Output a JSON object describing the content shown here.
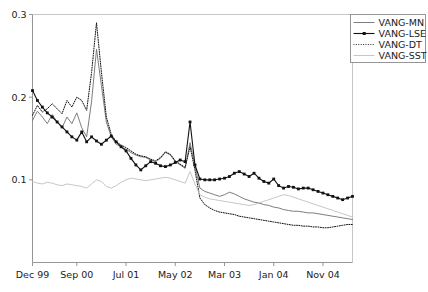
{
  "chart_data": {
    "type": "line",
    "title": "",
    "xlabel": "",
    "ylabel": "",
    "grid": false,
    "legend_position": "top-right",
    "ylim": [
      0.0,
      0.3
    ],
    "yticks": [
      0.1,
      0.2,
      0.3
    ],
    "ytick_labels": [
      "0.1",
      "0.2",
      "0.3"
    ],
    "xticks": [
      0,
      9,
      19,
      29,
      39,
      49,
      59
    ],
    "xtick_labels": [
      "Dec 99",
      "Sep 00",
      "Jul 01",
      "May 02",
      "Mar 03",
      "Jan 04",
      "Nov 04"
    ],
    "x_index_range": [
      0,
      65
    ],
    "series": [
      {
        "name": "VANG-MN",
        "style": "solid",
        "color": "#6e6e6e",
        "marker": "none",
        "values": [
          0.172,
          0.183,
          0.176,
          0.168,
          0.179,
          0.17,
          0.163,
          0.176,
          0.168,
          0.181,
          0.163,
          0.152,
          0.195,
          0.258,
          0.214,
          0.17,
          0.152,
          0.143,
          0.14,
          0.137,
          0.133,
          0.13,
          0.128,
          0.127,
          0.124,
          0.122,
          0.126,
          0.133,
          0.13,
          0.122,
          0.118,
          0.114,
          0.145,
          0.117,
          0.09,
          0.086,
          0.084,
          0.082,
          0.08,
          0.082,
          0.085,
          0.083,
          0.08,
          0.077,
          0.075,
          0.073,
          0.072,
          0.07,
          0.069,
          0.067,
          0.066,
          0.064,
          0.063,
          0.062,
          0.062,
          0.061,
          0.06,
          0.06,
          0.059,
          0.058,
          0.057,
          0.056,
          0.055,
          0.054,
          0.053,
          0.052
        ]
      },
      {
        "name": "VANG-LSE",
        "style": "solid",
        "color": "#111111",
        "marker": "square",
        "values": [
          0.208,
          0.196,
          0.188,
          0.181,
          0.176,
          0.17,
          0.164,
          0.158,
          0.152,
          0.148,
          0.158,
          0.146,
          0.152,
          0.147,
          0.143,
          0.148,
          0.153,
          0.146,
          0.14,
          0.135,
          0.126,
          0.118,
          0.112,
          0.117,
          0.122,
          0.12,
          0.117,
          0.116,
          0.118,
          0.121,
          0.124,
          0.122,
          0.17,
          0.118,
          0.101,
          0.1,
          0.1,
          0.1,
          0.101,
          0.102,
          0.104,
          0.108,
          0.11,
          0.107,
          0.104,
          0.108,
          0.102,
          0.098,
          0.096,
          0.101,
          0.093,
          0.09,
          0.092,
          0.091,
          0.089,
          0.09,
          0.09,
          0.088,
          0.086,
          0.084,
          0.082,
          0.08,
          0.078,
          0.076,
          0.078,
          0.08
        ]
      },
      {
        "name": "VANG-DT",
        "style": "dotted",
        "color": "#111111",
        "marker": "none",
        "values": [
          0.178,
          0.19,
          0.182,
          0.186,
          0.192,
          0.186,
          0.18,
          0.196,
          0.188,
          0.2,
          0.196,
          0.184,
          0.23,
          0.29,
          0.23,
          0.176,
          0.155,
          0.146,
          0.142,
          0.139,
          0.135,
          0.131,
          0.129,
          0.128,
          0.125,
          0.123,
          0.127,
          0.134,
          0.131,
          0.123,
          0.119,
          0.115,
          0.14,
          0.112,
          0.078,
          0.07,
          0.066,
          0.063,
          0.061,
          0.06,
          0.059,
          0.058,
          0.056,
          0.055,
          0.054,
          0.053,
          0.052,
          0.051,
          0.05,
          0.049,
          0.048,
          0.047,
          0.046,
          0.045,
          0.045,
          0.044,
          0.044,
          0.043,
          0.043,
          0.042,
          0.042,
          0.043,
          0.044,
          0.045,
          0.046,
          0.046
        ]
      },
      {
        "name": "VANG-SST",
        "style": "solid",
        "color": "#c0c0c0",
        "marker": "none",
        "values": [
          0.098,
          0.096,
          0.095,
          0.097,
          0.096,
          0.094,
          0.093,
          0.095,
          0.094,
          0.093,
          0.092,
          0.09,
          0.095,
          0.1,
          0.098,
          0.092,
          0.09,
          0.093,
          0.097,
          0.1,
          0.102,
          0.101,
          0.1,
          0.099,
          0.1,
          0.101,
          0.102,
          0.103,
          0.102,
          0.1,
          0.098,
          0.096,
          0.11,
          0.095,
          0.082,
          0.079,
          0.077,
          0.076,
          0.075,
          0.074,
          0.073,
          0.072,
          0.071,
          0.07,
          0.069,
          0.07,
          0.072,
          0.074,
          0.076,
          0.078,
          0.08,
          0.082,
          0.081,
          0.079,
          0.077,
          0.075,
          0.073,
          0.071,
          0.069,
          0.067,
          0.065,
          0.063,
          0.061,
          0.059,
          0.057,
          0.055
        ]
      }
    ]
  },
  "legend": {
    "entries": [
      {
        "label": "VANG-MN"
      },
      {
        "label": "VANG-LSE"
      },
      {
        "label": "VANG-DT"
      },
      {
        "label": "VANG-SST"
      }
    ]
  }
}
